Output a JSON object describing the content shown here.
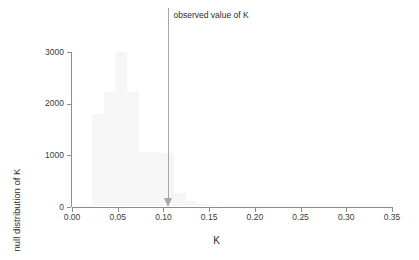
{
  "chart_data": {
    "type": "bar",
    "title": "",
    "subtitle": "",
    "xlabel": "K",
    "ylabel": "null distribution of K",
    "xlim": [
      0.0,
      0.35
    ],
    "ylim": [
      0,
      3000
    ],
    "grid": false,
    "legend": null,
    "xticks": [
      "0.00",
      "0.05",
      "0.10",
      "0.15",
      "0.20",
      "0.25",
      "0.30",
      "0.35"
    ],
    "xtick_values": [
      0.0,
      0.05,
      0.1,
      0.15,
      0.2,
      0.25,
      0.3,
      0.35
    ],
    "yticks": [
      "0",
      "1000",
      "2000",
      "3000"
    ],
    "ytick_values": [
      0,
      1000,
      2000,
      3000
    ],
    "bin_width": 0.0128,
    "bar_color": "#f6f6f6",
    "axis_color": "#8c8c8c",
    "bins": [
      {
        "x0": 0.0218,
        "x1": 0.0346,
        "value": 1790
      },
      {
        "x0": 0.0346,
        "x1": 0.0474,
        "value": 2215
      },
      {
        "x0": 0.0474,
        "x1": 0.0602,
        "value": 3740
      },
      {
        "x0": 0.0602,
        "x1": 0.073,
        "value": 2205
      },
      {
        "x0": 0.073,
        "x1": 0.0858,
        "value": 1055
      },
      {
        "x0": 0.0858,
        "x1": 0.0986,
        "value": 1040
      },
      {
        "x0": 0.0986,
        "x1": 0.1114,
        "value": 1020
      },
      {
        "x0": 0.1114,
        "x1": 0.1242,
        "value": 250
      },
      {
        "x0": 0.1242,
        "x1": 0.137,
        "value": 105
      },
      {
        "x0": 0.137,
        "x1": 0.1498,
        "value": 45
      },
      {
        "x0": 0.1498,
        "x1": 0.1626,
        "value": 20
      }
    ],
    "annotations": [
      {
        "kind": "arrow-down",
        "label": "observed value of K",
        "x": 0.1045,
        "y_top": 2900,
        "y_tip": 0,
        "color": "#a8a8a8",
        "label_color": "#2b2b2b"
      }
    ]
  }
}
